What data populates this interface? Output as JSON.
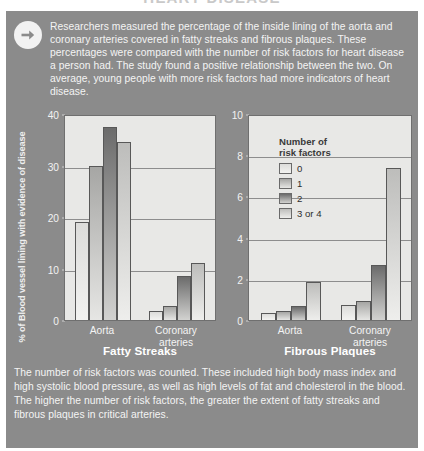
{
  "header": {
    "title": "HEART DISEASE"
  },
  "intro": {
    "icon": "arrow-right-circle-icon",
    "text": "Researchers measured the percentage of the inside lining of the aorta and coronary arteries covered in fatty streaks and fibrous plaques. These percentages were compared with the number of risk factors for heart disease a person had. The study found a positive relationship between the two. On average, young people with more risk factors had more indicators of heart disease."
  },
  "shared": {
    "ylabel": "% of Blood vessel lining with evidence of disease",
    "legend": {
      "title_line1": "Number of",
      "title_line2": "risk factors",
      "entries": [
        "0",
        "1",
        "2",
        "3 or 4"
      ]
    },
    "categories": [
      "Aorta",
      "Coronary arteries"
    ],
    "category_labels": [
      {
        "line1": "Aorta",
        "line2": ""
      },
      {
        "line1": "Coronary",
        "line2": "arteries"
      }
    ]
  },
  "chart_data": [
    {
      "type": "bar",
      "id": "fatty-streaks",
      "title": "Fatty Streaks",
      "xlabel": "",
      "ylabel": "% of Blood vessel lining with evidence of disease",
      "categories": [
        "Aorta",
        "Coronary arteries"
      ],
      "series": [
        {
          "name": "0",
          "values": [
            19.0,
            1.8
          ]
        },
        {
          "name": "1",
          "values": [
            30.0,
            2.8
          ]
        },
        {
          "name": "2",
          "values": [
            37.5,
            8.5
          ]
        },
        {
          "name": "3 or 4",
          "values": [
            34.5,
            11.0
          ]
        }
      ],
      "ylim": [
        0,
        40
      ],
      "yticks": [
        0,
        10,
        20,
        30,
        40
      ],
      "grid": true,
      "legend_position": "none"
    },
    {
      "type": "bar",
      "id": "fibrous-plaques",
      "title": "Fibrous Plaques",
      "xlabel": "",
      "ylabel": "% of Blood vessel lining with evidence of disease",
      "categories": [
        "Aorta",
        "Coronary arteries"
      ],
      "series": [
        {
          "name": "0",
          "values": [
            0.35,
            0.75
          ]
        },
        {
          "name": "1",
          "values": [
            0.45,
            0.9
          ]
        },
        {
          "name": "2",
          "values": [
            0.7,
            2.65
          ]
        },
        {
          "name": "3 or 4",
          "values": [
            1.85,
            7.4
          ]
        }
      ],
      "ylim": [
        0,
        10
      ],
      "yticks": [
        0,
        2,
        4,
        6,
        8,
        10
      ],
      "grid": true,
      "legend_position": "inside-top-left"
    }
  ],
  "caption": {
    "text": "The number of risk factors was counted. These included high body mass index and high systolic blood pressure, as well as high levels of fat and cholesterol in the blood. The higher the number of risk factors, the greater the extent of fatty streaks and fibrous plaques in critical arteries."
  },
  "colors": {
    "panel_background": "#8b8b8b",
    "plot_background": "#e8e8e6",
    "text_light": "#f4f4f4",
    "gridline": "#8d8d8d",
    "series_0": "#f0f0ee",
    "series_1": "#c9c9c7",
    "series_2": "#8a8a8a",
    "series_3": "#dddddb"
  }
}
